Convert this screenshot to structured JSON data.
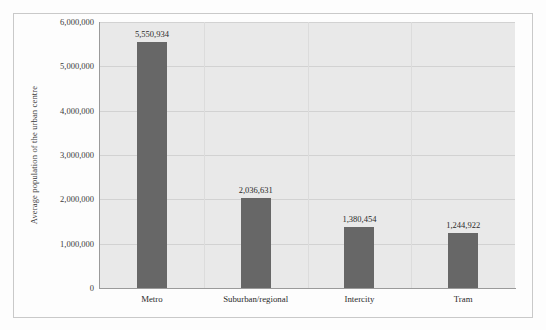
{
  "chart_data": {
    "type": "bar",
    "title": "",
    "subtitle": "",
    "xlabel": "",
    "ylabel": "Average population of the urban centre",
    "categories": [
      "Metro",
      "Suburban/regional",
      "Intercity",
      "Tram"
    ],
    "values": [
      5550934,
      2036631,
      1380454,
      1244922
    ],
    "value_labels": [
      "5,550,934",
      "2,036,631",
      "1,380,454",
      "1,244,922"
    ],
    "ylim": [
      0,
      6000000
    ],
    "ytick_values": [
      0,
      1000000,
      2000000,
      3000000,
      4000000,
      5000000,
      6000000
    ],
    "ytick_labels": [
      "0",
      "1,000,000",
      "2,000,000",
      "3,000,000",
      "4,000,000",
      "5,000,000",
      "6,000,000"
    ],
    "grid": "horizontal-and-vertical",
    "legend": "none",
    "colors": {
      "bar": "#676767",
      "plot_background": "#e9e9e9",
      "gridline": "#d2d2d2",
      "axis_line": "#9a9a9a",
      "frame": "#c9c9c9",
      "text": "#2b2b2b",
      "figure_background": "#fdfdfd"
    }
  }
}
